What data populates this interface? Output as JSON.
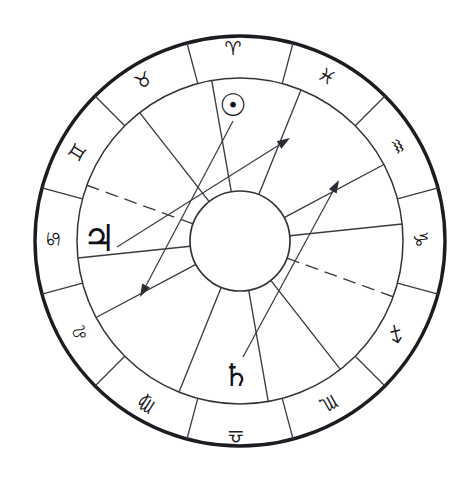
{
  "chart": {
    "center_x": 240,
    "center_y": 241,
    "outer_radius": 205,
    "zodiac_inner_radius": 163,
    "hub_radius": 50,
    "colors": {
      "outer_ring_stroke": "#1c1c22",
      "inner_stroke": "#33333c",
      "line": "#3a3a44",
      "glyph": "#1a1a20",
      "background": "#ffffff"
    }
  },
  "zodiac": {
    "ring_label": "Zodiac Sign Ring",
    "signs": [
      {
        "key": "aries",
        "name": "Aries",
        "glyph": "♈",
        "angle_deg": 90,
        "label_x": 233,
        "label_y": 48,
        "rotation": 0
      },
      {
        "key": "taurus",
        "name": "Taurus",
        "glyph": "♉",
        "angle_deg": 120,
        "label_x": 143,
        "label_y": 80,
        "rotation": -29
      },
      {
        "key": "gemini",
        "name": "Gemini",
        "glyph": "♊",
        "label_x": 77,
        "label_y": 152,
        "rotation": -58
      },
      {
        "key": "cancer",
        "name": "Cancer",
        "glyph": "♋",
        "label_x": 53,
        "label_y": 239,
        "rotation": -88
      },
      {
        "key": "leo",
        "name": "Leo",
        "glyph": "♌",
        "label_x": 80,
        "label_y": 333,
        "rotation": -119
      },
      {
        "key": "virgo",
        "name": "Virgo",
        "glyph": "♍",
        "label_x": 146,
        "label_y": 405,
        "rotation": -148
      },
      {
        "key": "libra",
        "name": "Libra",
        "glyph": "♎",
        "label_x": 236,
        "label_y": 437,
        "rotation": 180
      },
      {
        "key": "scorpio",
        "name": "Scorpio",
        "glyph": "♏",
        "label_x": 329,
        "label_y": 404,
        "rotation": 151
      },
      {
        "key": "sagittarius",
        "name": "Sagittarius",
        "glyph": "♐",
        "label_x": 396,
        "label_y": 334,
        "rotation": 122
      },
      {
        "key": "capricorn",
        "name": "Capricorn",
        "glyph": "♑",
        "label_x": 421,
        "label_y": 239,
        "rotation": 92
      },
      {
        "key": "aquarius",
        "name": "Aquarius",
        "glyph": "♒",
        "label_x": 398,
        "label_y": 146,
        "rotation": 62
      },
      {
        "key": "pisces",
        "name": "Pisces",
        "glyph": "♓",
        "label_x": 327,
        "label_y": 76,
        "rotation": 31
      }
    ]
  },
  "planets": [
    {
      "key": "sun",
      "name": "Sun",
      "glyph": "☉",
      "sign": "Aries",
      "label_x": 233,
      "label_y": 105,
      "class": "glyph-planet-sun"
    },
    {
      "key": "jupiter",
      "name": "Jupiter",
      "glyph": "♃",
      "sign": "Cancer",
      "label_x": 99,
      "label_y": 238,
      "class": "glyph-planet-jupiter"
    },
    {
      "key": "saturn",
      "name": "Saturn",
      "glyph": "♄",
      "sign": "Libra",
      "label_x": 236,
      "label_y": 375,
      "class": "glyph-planet-saturn"
    }
  ],
  "sign_dividers": [
    {
      "key": "divider-0",
      "angle_deg": 75
    },
    {
      "key": "divider-1",
      "angle_deg": 105
    },
    {
      "key": "divider-2",
      "angle_deg": 135
    },
    {
      "key": "divider-3",
      "angle_deg": 165
    },
    {
      "key": "divider-4",
      "angle_deg": 195
    },
    {
      "key": "divider-5",
      "angle_deg": 225
    },
    {
      "key": "divider-6",
      "angle_deg": 255
    },
    {
      "key": "divider-7",
      "angle_deg": 285
    },
    {
      "key": "divider-8",
      "angle_deg": 315
    },
    {
      "key": "divider-9",
      "angle_deg": 345
    },
    {
      "key": "divider-10",
      "angle_deg": 15
    },
    {
      "key": "divider-11",
      "angle_deg": 45
    }
  ],
  "house_cusps": [
    {
      "key": "cusp-1",
      "angle_deg": 68,
      "style": "solid"
    },
    {
      "key": "cusp-2",
      "angle_deg": 100,
      "style": "solid"
    },
    {
      "key": "cusp-3",
      "angle_deg": 128,
      "style": "solid"
    },
    {
      "key": "cusp-4",
      "angle_deg": 160,
      "style": "dashed"
    },
    {
      "key": "cusp-5",
      "angle_deg": 186,
      "style": "solid"
    },
    {
      "key": "cusp-6",
      "angle_deg": 208,
      "style": "solid"
    },
    {
      "key": "cusp-7",
      "angle_deg": 248,
      "style": "solid"
    },
    {
      "key": "cusp-8",
      "angle_deg": 280,
      "style": "solid"
    },
    {
      "key": "cusp-9",
      "angle_deg": 308,
      "style": "solid"
    },
    {
      "key": "cusp-10",
      "angle_deg": 340,
      "style": "dashed"
    },
    {
      "key": "cusp-11",
      "angle_deg": 6,
      "style": "solid"
    },
    {
      "key": "cusp-12",
      "angle_deg": 28,
      "style": "solid"
    }
  ],
  "aspect_arrows": [
    {
      "key": "aspect-sun",
      "name": "Sun aspect arrow",
      "from_planet": "Sun",
      "x1": 233,
      "y1": 121,
      "x2": 140,
      "y2": 297
    },
    {
      "key": "aspect-jupiter",
      "name": "Jupiter aspect arrow",
      "from_planet": "Jupiter",
      "x1": 117,
      "y1": 247,
      "x2": 290,
      "y2": 138
    },
    {
      "key": "aspect-saturn",
      "name": "Saturn aspect arrow",
      "from_planet": "Saturn",
      "x1": 243,
      "y1": 357,
      "x2": 339,
      "y2": 180
    }
  ]
}
